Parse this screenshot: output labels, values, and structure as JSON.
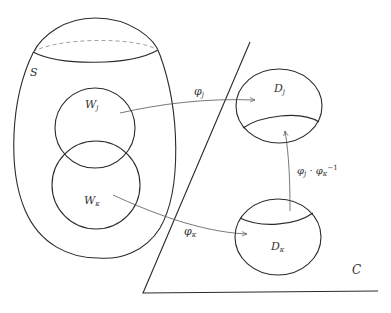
{
  "diagram": {
    "title": "",
    "colors": {
      "line": "#2a2a2a",
      "arrow": "#555555",
      "dashed": "#888888",
      "background": "#ffffff"
    },
    "surface": {
      "label": "S"
    },
    "plane": {
      "label": "C"
    },
    "neighborhoods": [
      {
        "id": "Wj",
        "label_base": "W",
        "label_sub": "j"
      },
      {
        "id": "Wk",
        "label_base": "W",
        "label_sub": "κ"
      }
    ],
    "disks": [
      {
        "id": "Dj",
        "label_base": "D",
        "label_sub": "j"
      },
      {
        "id": "Dk",
        "label_base": "D",
        "label_sub": "κ"
      }
    ],
    "maps": [
      {
        "id": "phi_j",
        "from": "Wj",
        "to": "Dj",
        "label_base": "φ",
        "label_sub": "j"
      },
      {
        "id": "phi_k",
        "from": "Wk",
        "to": "Dk",
        "label_base": "φ",
        "label_sub": "κ"
      },
      {
        "id": "transition",
        "from": "Dk",
        "to": "Dj",
        "label_a_base": "φ",
        "label_a_sub": "j",
        "label_dot": "·",
        "label_b_base": "φ",
        "label_b_sub": "κ",
        "label_b_sup": "−1"
      }
    ]
  }
}
